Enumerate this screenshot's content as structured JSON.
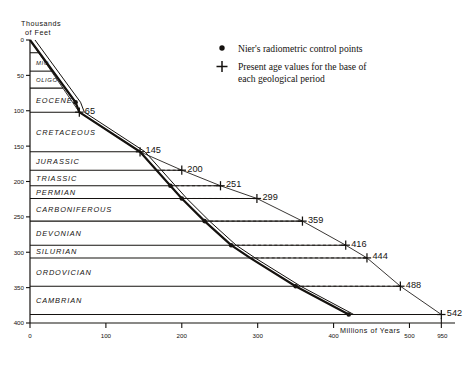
{
  "chart_data": {
    "type": "line",
    "title": "",
    "ylabel": "Thousands of Feet",
    "xlabel": "Millions of Years",
    "xlim": [
      0,
      560
    ],
    "ylim": [
      0,
      400
    ],
    "x_ticks": [
      0,
      100,
      200,
      300,
      400,
      500
    ],
    "x_tick_labels": [
      "0",
      "100",
      "200",
      "300",
      "400",
      "500"
    ],
    "x_extra_tick_label": "950",
    "y_ticks": [
      0,
      50,
      100,
      150,
      200,
      250,
      300,
      350,
      400
    ],
    "y_tick_labels": [
      "0",
      "50",
      "100",
      "150",
      "200",
      "250",
      "300",
      "350",
      "400"
    ],
    "grid": false,
    "strata": [
      {
        "name": "MIO",
        "top": 18,
        "bottom": 44
      },
      {
        "name": "OLIGO",
        "top": 44,
        "bottom": 68
      },
      {
        "name": "EOCENE",
        "top": 68,
        "bottom": 102
      },
      {
        "name": "CRETACEOUS",
        "top": 102,
        "bottom": 158
      },
      {
        "name": "JURASSIC",
        "top": 158,
        "bottom": 184
      },
      {
        "name": "TRIASSIC",
        "top": 184,
        "bottom": 206
      },
      {
        "name": "PERMIAN",
        "top": 206,
        "bottom": 224
      },
      {
        "name": "CARBONIFEROUS",
        "top": 224,
        "bottom": 256
      },
      {
        "name": "DEVONIAN",
        "top": 256,
        "bottom": 290
      },
      {
        "name": "SILURIAN",
        "top": 290,
        "bottom": 308
      },
      {
        "name": "ORDOVICIAN",
        "top": 308,
        "bottom": 348
      },
      {
        "name": "CAMBRIAN",
        "top": 348,
        "bottom": 388
      }
    ],
    "series": [
      {
        "name": "Nier's radiometric control points",
        "marker": "dot",
        "style": "thick-solid",
        "points": [
          {
            "x": 0,
            "y": 0
          },
          {
            "x": 60,
            "y": 88
          },
          {
            "x": 65,
            "y": 102
          },
          {
            "x": 145,
            "y": 158
          },
          {
            "x": 185,
            "y": 206
          },
          {
            "x": 200,
            "y": 224
          },
          {
            "x": 230,
            "y": 256
          },
          {
            "x": 265,
            "y": 290
          },
          {
            "x": 290,
            "y": 308
          },
          {
            "x": 350,
            "y": 348
          },
          {
            "x": 420,
            "y": 388
          }
        ],
        "marker_points": [
          {
            "x": 60,
            "y": 88
          },
          {
            "x": 185,
            "y": 206
          },
          {
            "x": 200,
            "y": 224
          },
          {
            "x": 230,
            "y": 256
          },
          {
            "x": 265,
            "y": 290
          },
          {
            "x": 350,
            "y": 348
          },
          {
            "x": 420,
            "y": 388
          }
        ]
      },
      {
        "name": "Present age values for the base of each geological period",
        "marker": "plus",
        "style": "thin-solid",
        "points": [
          {
            "x": 0,
            "y": 0,
            "label": ""
          },
          {
            "x": 65,
            "y": 102,
            "label": "65"
          },
          {
            "x": 145,
            "y": 158,
            "label": "145"
          },
          {
            "x": 200,
            "y": 184,
            "label": "200"
          },
          {
            "x": 251,
            "y": 206,
            "label": "251"
          },
          {
            "x": 299,
            "y": 224,
            "label": "299"
          },
          {
            "x": 359,
            "y": 256,
            "label": "359"
          },
          {
            "x": 416,
            "y": 290,
            "label": "416"
          },
          {
            "x": 444,
            "y": 308,
            "label": "444"
          },
          {
            "x": 488,
            "y": 348,
            "label": "488"
          },
          {
            "x": 542,
            "y": 388,
            "label": "542"
          }
        ]
      }
    ],
    "legend_position": "top-right",
    "legend": [
      {
        "marker": "dot",
        "text": "Nier's radiometric control points"
      },
      {
        "marker": "plus",
        "text": "Present age values for the base of each geological period"
      }
    ]
  },
  "axes": {
    "y_axis_title_line1": "Thousands",
    "y_axis_title_line2": "of Feet",
    "x_axis_title": "Millions of Years"
  },
  "legend": {
    "item1": "Nier's radiometric control points",
    "item2_line1": "Present age values for the base of",
    "item2_line2": "each geological period"
  }
}
